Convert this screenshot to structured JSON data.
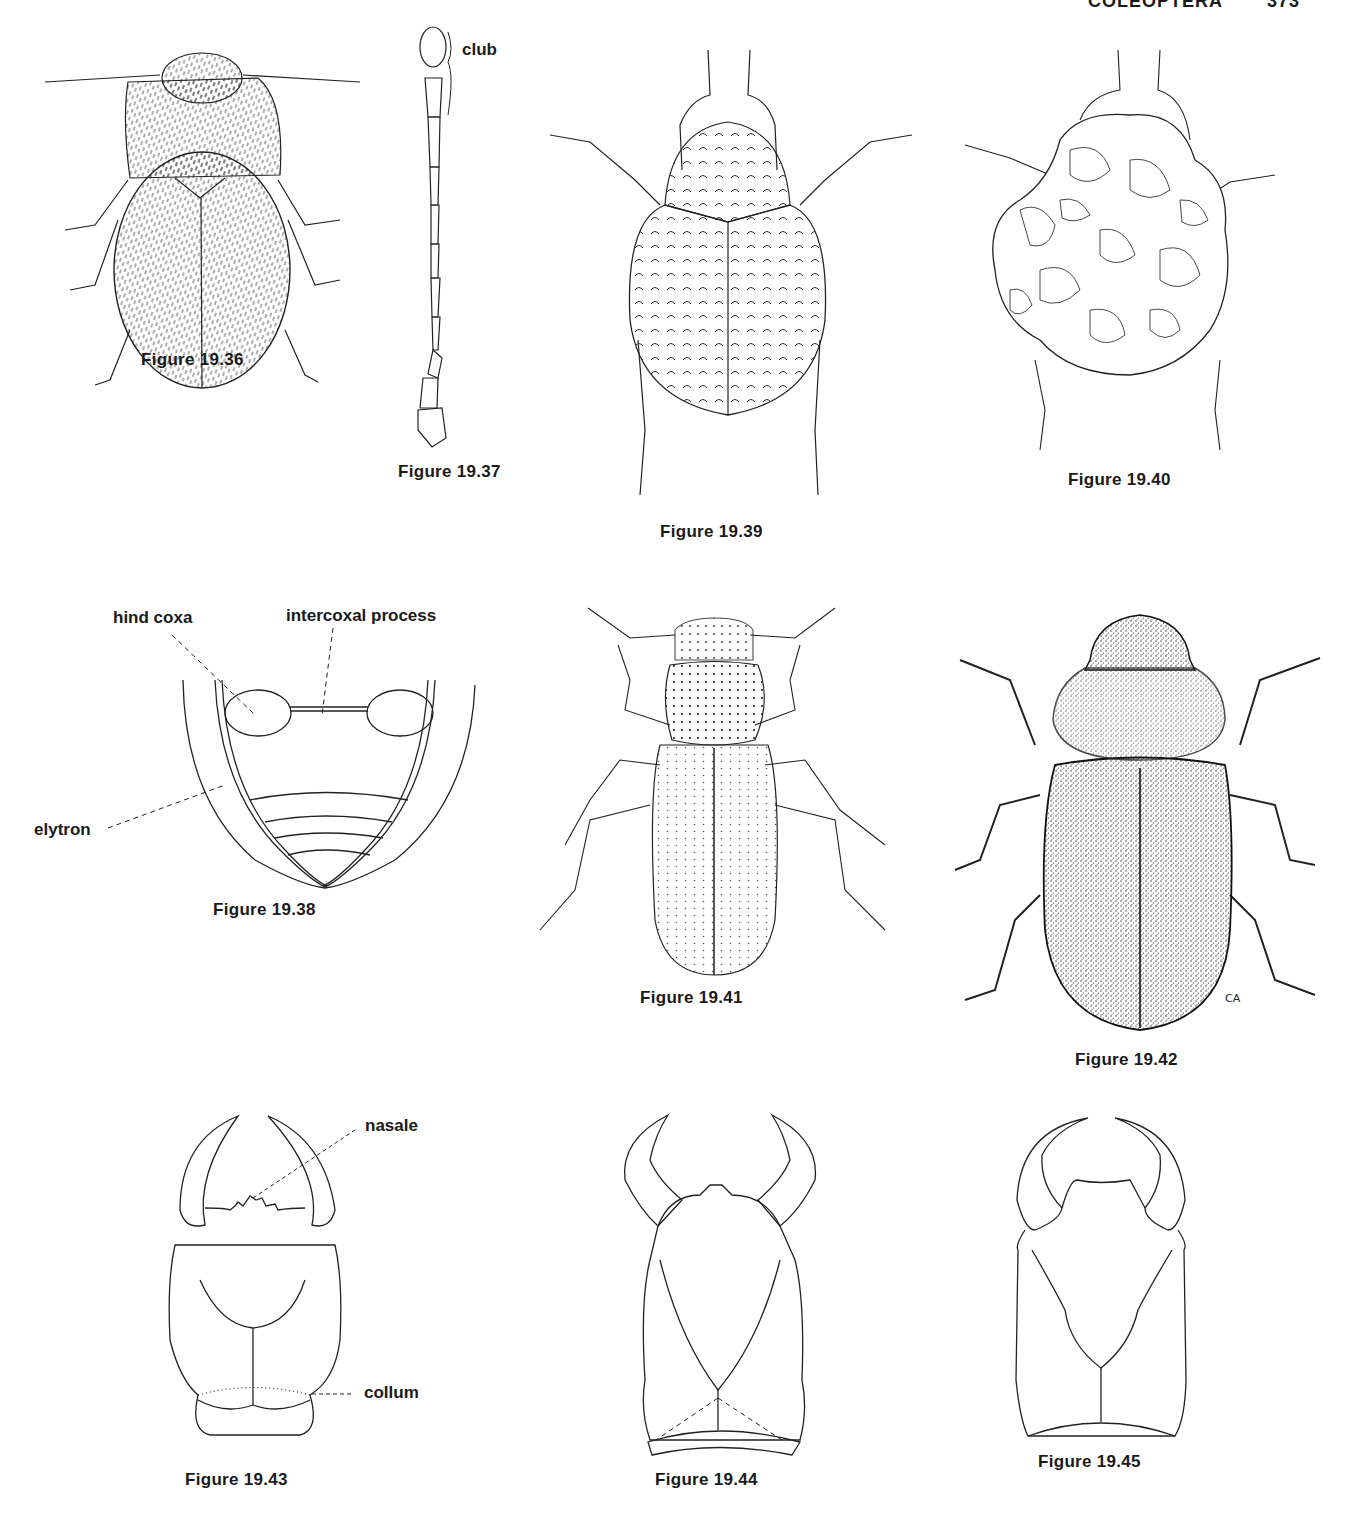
{
  "page": {
    "running_head": "COLEOPTERA",
    "page_number": "373"
  },
  "figures": [
    {
      "id": "19.36",
      "caption": "Figure 19.36",
      "subject": "hairy-beetle-dorsal-view"
    },
    {
      "id": "19.37",
      "caption": "Figure 19.37",
      "subject": "antenna-with-club",
      "labels": {
        "club": "club"
      }
    },
    {
      "id": "19.38",
      "caption": "Figure 19.38",
      "subject": "abdomen-ventral-view",
      "labels": {
        "hind_coxa": "hind coxa",
        "intercoxal_process": "intercoxal process",
        "elytron": "elytron"
      }
    },
    {
      "id": "19.39",
      "caption": "Figure 19.39",
      "subject": "punctate-beetle-dorsal-view"
    },
    {
      "id": "19.40",
      "caption": "Figure 19.40",
      "subject": "debris-covered-beetle-dorsal-view"
    },
    {
      "id": "19.41",
      "caption": "Figure 19.41",
      "subject": "elongate-beetle-dorsal-view"
    },
    {
      "id": "19.42",
      "caption": "Figure 19.42",
      "subject": "stippled-beetle-dorsal-view",
      "signature": "CA"
    },
    {
      "id": "19.43",
      "caption": "Figure 19.43",
      "subject": "larval-head-with-nasale-and-collum",
      "labels": {
        "nasale": "nasale",
        "collum": "collum"
      }
    },
    {
      "id": "19.44",
      "caption": "Figure 19.44",
      "subject": "larval-head-variant"
    },
    {
      "id": "19.45",
      "caption": "Figure 19.45",
      "subject": "larval-head-variant"
    }
  ]
}
